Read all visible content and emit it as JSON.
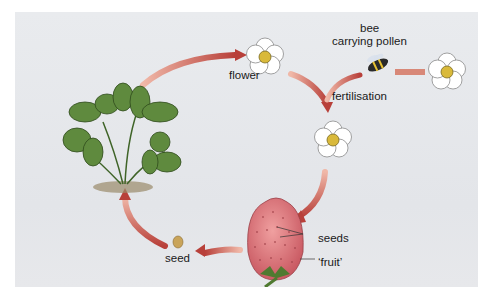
{
  "diagram": {
    "type": "life-cycle",
    "labels": {
      "flower": "flower",
      "bee_line1": "bee",
      "bee_line2": "carrying pollen",
      "fertilisation": "fertilisation",
      "seeds": "seeds",
      "fruit": "‘fruit’",
      "seed": "seed"
    },
    "stages": [
      "plant",
      "flower",
      "fertilisation",
      "fruit",
      "seed"
    ],
    "colors": {
      "background": "#e6e8eb",
      "arrow": "#c0504d",
      "arrow_light": "#e8a090",
      "leaf": "#5f8a3e",
      "leaf_dark": "#3f6428",
      "petal": "#ffffff",
      "flower_center": "#d9b93a",
      "strawberry": "#d8707a",
      "seed": "#c9a45a"
    }
  }
}
